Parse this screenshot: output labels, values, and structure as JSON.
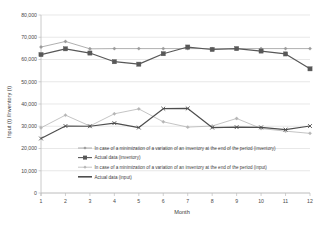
{
  "chart_data": {
    "type": "line",
    "title": "",
    "xlabel": "Month",
    "ylabel": "Input (t) /Inventory (t)",
    "x": [
      1,
      2,
      3,
      4,
      5,
      6,
      7,
      8,
      9,
      10,
      11,
      12
    ],
    "xtick_labels": [
      "1",
      "2",
      "3",
      "4",
      "5",
      "6",
      "7",
      "8",
      "9",
      "10",
      "11",
      "12"
    ],
    "ytick_labels": [
      "0",
      "10,000",
      "20,000",
      "30,000",
      "40,000",
      "50,000",
      "60,000",
      "70,000",
      "80,000"
    ],
    "ytick_values": [
      0,
      10000,
      20000,
      30000,
      40000,
      50000,
      60000,
      70000,
      80000
    ],
    "ylim": [
      0,
      80000
    ],
    "xlim": [
      1,
      12
    ],
    "grid": true,
    "legend_position": "inside-bottom-center",
    "series": [
      {
        "name": "In case of a minimization of a variation of an inventory at the end of the period (inventory)",
        "short": "min-variation-inventory",
        "color": "#9a9a9a",
        "marker": "tiny-diamond",
        "line_width": 0.8,
        "values": [
          65600,
          68100,
          64800,
          64900,
          64900,
          64900,
          64900,
          64900,
          64900,
          64900,
          64900,
          64900
        ]
      },
      {
        "name": "Actual data (inventory)",
        "short": "actual-inventory",
        "color": "#585858",
        "marker": "square",
        "line_width": 1.2,
        "values": [
          62200,
          64800,
          62900,
          59000,
          57900,
          62600,
          65600,
          64500,
          64900,
          63800,
          62500,
          55800
        ]
      },
      {
        "name": "In case of a minimization of a variation of an inventory at the end of the period (input)",
        "short": "min-variation-input",
        "color": "#b5b5b5",
        "marker": "tiny-diamond",
        "line_width": 0.8,
        "values": [
          29300,
          35000,
          30100,
          35600,
          37800,
          32000,
          29600,
          30100,
          33500,
          29000,
          27800,
          26800
        ]
      },
      {
        "name": "Actual data (input)",
        "short": "actual-input",
        "color": "#4e4e4e",
        "marker": "x",
        "line_width": 1.2,
        "values": [
          24500,
          30100,
          30000,
          31400,
          29400,
          37900,
          38000,
          29400,
          29600,
          29500,
          28500,
          30100
        ]
      }
    ]
  },
  "legend": {
    "items": [
      {
        "label": "In case of a minimization of a variation of an inventory at the end of the period (inventory)",
        "marker": "line-diamond",
        "color": "#9a9a9a"
      },
      {
        "label": "Actual data (inventory)",
        "marker": "line-square",
        "color": "#585858"
      },
      {
        "label": "In case of a minimization of a variation of an inventory at the end of the period (input)",
        "marker": "line-diamond",
        "color": "#b5b5b5"
      },
      {
        "label": "Actual data (input)",
        "marker": "line-thick",
        "color": "#4e4e4e"
      }
    ]
  },
  "axes": {
    "x_title": "Month",
    "y_title": "Input (t) /Inventory (t)"
  },
  "colors": {
    "grid": "#d9d9d9",
    "axis": "#bdbdbd",
    "text": "#3d3d3d",
    "background": "#ffffff"
  }
}
